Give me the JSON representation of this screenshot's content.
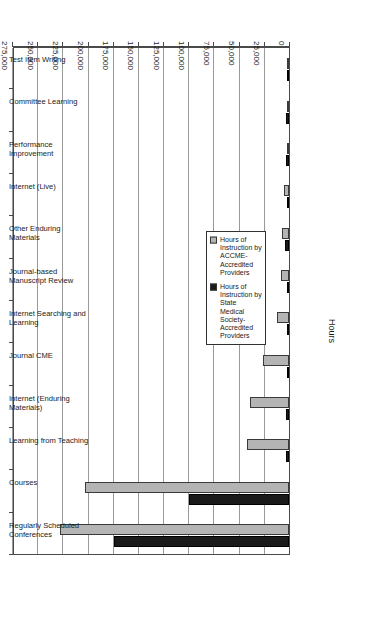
{
  "chart_data": {
    "type": "bar",
    "orientation": "horizontal",
    "title": "",
    "xlabel": "Hours",
    "ylabel": "",
    "xlim": [
      0,
      275000
    ],
    "grid": true,
    "legend_position": "inside-left",
    "tick_labels": [
      "0",
      "25,000",
      "50,000",
      "75,000",
      "100,000",
      "125,000",
      "150,000",
      "175,000",
      "200,000",
      "225,000",
      "250,000",
      "275,000"
    ],
    "tick_values": [
      0,
      25000,
      50000,
      75000,
      100000,
      125000,
      150000,
      175000,
      200000,
      225000,
      250000,
      275000
    ],
    "categories": [
      "Regularly Scheduled Conferences",
      "Courses",
      "Learning from Teaching",
      "Internet (Enduring Materials)",
      "Journal CME",
      "Internet Searching and Learning",
      "Journal-based Manuscript Review",
      "Other Enduring Materials",
      "Internet (Live)",
      "Performance Improvement",
      "Committee Learning",
      "Test Item Writing"
    ],
    "series": [
      {
        "name": "Hours of Instruction by ACCME-Accredited Providers",
        "color": "#b4b4b4",
        "values": [
          227000,
          203000,
          42000,
          39000,
          25500,
          12000,
          8000,
          7000,
          4500,
          2000,
          1500,
          800
        ]
      },
      {
        "name": "Hours of Instruction by State Medical Society-Accredited Providers",
        "color": "#1a1a1a",
        "values": [
          173500,
          99000,
          3000,
          2500,
          1200,
          1500,
          900,
          3500,
          2200,
          3000,
          3200,
          600
        ]
      }
    ]
  },
  "legend": {
    "items": [
      {
        "label": "Hours of Instruction by ACCME-Accredited Providers",
        "color": "#b4b4b4",
        "swatch_name": "legend-swatch-accme"
      },
      {
        "label": "Hours of Instruction by State Medical Society-Accredited Providers",
        "color": "#1a1a1a",
        "swatch_name": "legend-swatch-state"
      }
    ]
  },
  "axis": {
    "value_axis_title": "Hours"
  }
}
